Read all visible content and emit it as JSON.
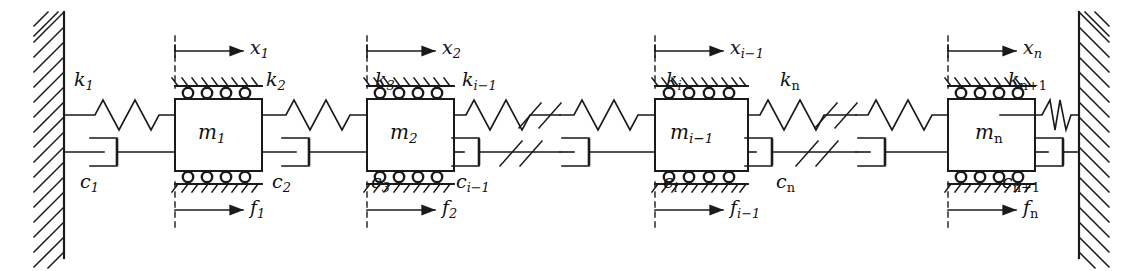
{
  "figure": {
    "type": "mechanical-schematic",
    "width": 1143,
    "height": 271,
    "stroke_color": "#1a1a1a",
    "background_color": "#ffffff"
  },
  "walls": {
    "left": {
      "name": "fixed-wall-left",
      "hatch_direction": "down-right"
    },
    "right": {
      "name": "fixed-wall-right",
      "hatch_direction": "down-right"
    }
  },
  "masses": [
    {
      "label": "m",
      "sub": "1",
      "name": "mass-m1"
    },
    {
      "label": "m",
      "sub": "2",
      "name": "mass-m2"
    },
    {
      "label": "m",
      "sub": "i−1",
      "name": "mass-mi-1"
    },
    {
      "label": "m",
      "sub": "n",
      "name": "mass-mn"
    }
  ],
  "springs": [
    {
      "label": "k",
      "sub": "1"
    },
    {
      "label": "k",
      "sub": "2"
    },
    {
      "label": "k",
      "sub": "3"
    },
    {
      "label": "k",
      "sub": "i−1"
    },
    {
      "label": "k",
      "sub": "i"
    },
    {
      "label": "k",
      "sub": "n"
    },
    {
      "label": "k",
      "sub": "n+1"
    }
  ],
  "dampers": [
    {
      "label": "c",
      "sub": "1"
    },
    {
      "label": "c",
      "sub": "2"
    },
    {
      "label": "c",
      "sub": "3"
    },
    {
      "label": "c",
      "sub": "i−1"
    },
    {
      "label": "c",
      "sub": "i"
    },
    {
      "label": "c",
      "sub": "n"
    },
    {
      "label": "c",
      "sub": "n+1"
    }
  ],
  "displacements": [
    {
      "label": "x",
      "sub": "1"
    },
    {
      "label": "x",
      "sub": "2"
    },
    {
      "label": "x",
      "sub": "i−1"
    },
    {
      "label": "x",
      "sub": "n"
    }
  ],
  "forces": [
    {
      "label": "f",
      "sub": "1"
    },
    {
      "label": "f",
      "sub": "2"
    },
    {
      "label": "f",
      "sub": "i−1"
    },
    {
      "label": "f",
      "sub": "n"
    }
  ],
  "break_marks": {
    "count": 4,
    "style": "double-slash",
    "description": "continuation break on spring and damper lines"
  },
  "label_positions": {
    "k": [
      {
        "x": 74,
        "y": 70
      },
      {
        "x": 266,
        "y": 70
      },
      {
        "x": 375,
        "y": 70
      },
      {
        "x": 462,
        "y": 70
      },
      {
        "x": 666,
        "y": 70
      },
      {
        "x": 780,
        "y": 70
      },
      {
        "x": 1012,
        "y": 70
      }
    ],
    "c": [
      {
        "x": 80,
        "y": 172
      },
      {
        "x": 272,
        "y": 172
      },
      {
        "x": 371,
        "y": 172
      },
      {
        "x": 456,
        "y": 172
      },
      {
        "x": 663,
        "y": 172
      },
      {
        "x": 776,
        "y": 172
      },
      {
        "x": 1006,
        "y": 172
      }
    ],
    "m": [
      {
        "x": 185,
        "y": 122
      },
      {
        "x": 377,
        "y": 122
      },
      {
        "x": 573,
        "y": 122
      },
      {
        "x": 903,
        "y": 122
      }
    ],
    "x": [
      {
        "x": 250,
        "y": 35
      },
      {
        "x": 442,
        "y": 35
      },
      {
        "x": 640,
        "y": 35
      },
      {
        "x": 972,
        "y": 35
      }
    ],
    "f": [
      {
        "x": 250,
        "y": 222
      },
      {
        "x": 442,
        "y": 222
      },
      {
        "x": 640,
        "y": 222
      },
      {
        "x": 972,
        "y": 222
      }
    ]
  }
}
